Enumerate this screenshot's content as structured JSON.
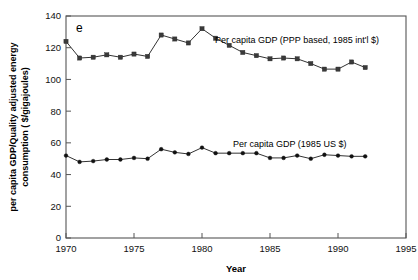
{
  "panel": {
    "label": "e"
  },
  "chart_data": {
    "type": "line",
    "title": "",
    "xlabel": "Year",
    "ylabel": "per capita GDP/Quality adjusted energy consumption ( $/gigajoules)",
    "ylabel_line1": "per capita GDP/Quality adjusted energy",
    "ylabel_line2": "consumption ( $/gigajoules)",
    "xlim": [
      1970,
      1995
    ],
    "ylim": [
      0,
      140
    ],
    "xticks": [
      1970,
      1975,
      1980,
      1985,
      1990,
      1995
    ],
    "xticklabels": [
      "1970",
      "1975",
      "1980",
      "1985",
      "1990",
      "1995"
    ],
    "yticks": [
      0,
      20,
      40,
      60,
      80,
      100,
      120,
      140
    ],
    "yticklabels": [
      "0",
      "20",
      "40",
      "60",
      "80",
      "100",
      "120",
      "140"
    ],
    "grid": false,
    "legend_position": "inline-annotations",
    "x": [
      1970,
      1971,
      1972,
      1973,
      1974,
      1975,
      1976,
      1977,
      1978,
      1979,
      1980,
      1981,
      1982,
      1983,
      1984,
      1985,
      1986,
      1987,
      1988,
      1989,
      1990,
      1991,
      1992
    ],
    "series": [
      {
        "name": "Per capita GDP (PPP based, 1985 int'l $)",
        "marker": "square",
        "annotation": "Per capita GDP (PPP based, 1985 int'l $)",
        "values": [
          124,
          113.5,
          114,
          115.5,
          114,
          116,
          114.5,
          128,
          125.5,
          123,
          132,
          126,
          121.5,
          117,
          115,
          113,
          113.5,
          113,
          110,
          106.5,
          106.5,
          111,
          107.5
        ]
      },
      {
        "name": "Per capita GDP (1985 US $)",
        "marker": "circle",
        "annotation": "Per capita GDP (1985 US $)",
        "values": [
          52,
          48,
          48.5,
          49.5,
          49.5,
          50.5,
          50,
          56,
          54,
          53,
          57,
          53.5,
          53.5,
          53.5,
          53.5,
          50.5,
          50.5,
          52,
          50,
          52.5,
          52,
          51.5,
          51.5
        ]
      }
    ],
    "annotations": [
      {
        "text": "Per capita GDP (PPP based, 1985 int'l $)",
        "x_px": 215,
        "y_px": 40
      },
      {
        "text": "Per capita GDP (1985 US $)",
        "x_px": 233,
        "y_px": 144
      }
    ],
    "colors": {
      "series1": "#333333",
      "series2": "#111111",
      "axis": "#555555"
    }
  }
}
